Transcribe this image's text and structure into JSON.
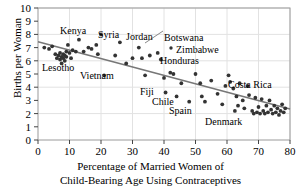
{
  "chart_data": {
    "type": "scatter",
    "title": "",
    "xlabel": "Percentage of Married Women of Child-Bearing Age Using Contraceptives",
    "xlabel_line1": "Percentage of Married Women of",
    "xlabel_line2": "Child-Bearing Age Using Contraceptives",
    "ylabel": "Births per Woman",
    "xlim": [
      0,
      80
    ],
    "ylim": [
      0,
      10
    ],
    "xticks": [
      0,
      10,
      20,
      30,
      40,
      50,
      60,
      70,
      80
    ],
    "yticks": [
      0,
      1,
      2,
      3,
      4,
      5,
      6,
      7,
      8,
      9,
      10
    ],
    "grid": "both, light gray at x ticks every 10 and y ticks every 2",
    "legend": "none",
    "point_color": "#333333",
    "trendline_color": "#777777",
    "trendline": {
      "x": [
        0,
        80
      ],
      "y": [
        7.45,
        2.35
      ],
      "label": "least-squares regression line"
    },
    "points": [
      {
        "x": 2.0,
        "y": 7.0
      },
      {
        "x": 3.5,
        "y": 6.9
      },
      {
        "x": 4.5,
        "y": 7.1
      },
      {
        "x": 5.5,
        "y": 6.5
      },
      {
        "x": 6.0,
        "y": 6.2
      },
      {
        "x": 6.5,
        "y": 6.4
      },
      {
        "x": 7.0,
        "y": 6.6
      },
      {
        "x": 7.0,
        "y": 6.1
      },
      {
        "x": 7.5,
        "y": 6.3
      },
      {
        "x": 7.5,
        "y": 5.8
      },
      {
        "x": 8.0,
        "y": 6.5
      },
      {
        "x": 8.0,
        "y": 6.2
      },
      {
        "x": 8.5,
        "y": 6.4
      },
      {
        "x": 8.5,
        "y": 6.0
      },
      {
        "x": 9.0,
        "y": 6.7
      },
      {
        "x": 9.0,
        "y": 6.3
      },
      {
        "x": 9.5,
        "y": 7.2
      },
      {
        "x": 10.0,
        "y": 6.6
      },
      {
        "x": 10.5,
        "y": 6.2
      },
      {
        "x": 11.0,
        "y": 6.8
      },
      {
        "x": 12.0,
        "y": 6.7
      },
      {
        "x": 13.0,
        "y": 7.6
      },
      {
        "x": 14.5,
        "y": 6.7
      },
      {
        "x": 16.0,
        "y": 7.0
      },
      {
        "x": 17.0,
        "y": 6.9
      },
      {
        "x": 18.5,
        "y": 7.2
      },
      {
        "x": 19.0,
        "y": 6.5
      },
      {
        "x": 20.0,
        "y": 8.0
      },
      {
        "x": 21.0,
        "y": 4.9
      },
      {
        "x": 24.5,
        "y": 6.4
      },
      {
        "x": 26.0,
        "y": 7.4
      },
      {
        "x": 28.0,
        "y": 5.8
      },
      {
        "x": 30.0,
        "y": 6.2
      },
      {
        "x": 32.0,
        "y": 7.0
      },
      {
        "x": 33.0,
        "y": 6.2
      },
      {
        "x": 34.0,
        "y": 4.9
      },
      {
        "x": 35.5,
        "y": 6.4
      },
      {
        "x": 38.0,
        "y": 6.6
      },
      {
        "x": 39.0,
        "y": 6.1
      },
      {
        "x": 40.0,
        "y": 4.7
      },
      {
        "x": 40.5,
        "y": 3.6
      },
      {
        "x": 42.0,
        "y": 5.1
      },
      {
        "x": 43.0,
        "y": 5.0
      },
      {
        "x": 44.0,
        "y": 3.3
      },
      {
        "x": 45.5,
        "y": 4.3
      },
      {
        "x": 48.0,
        "y": 2.9
      },
      {
        "x": 50.0,
        "y": 5.0
      },
      {
        "x": 51.5,
        "y": 4.3
      },
      {
        "x": 52.0,
        "y": 3.3
      },
      {
        "x": 53.0,
        "y": 2.9
      },
      {
        "x": 55.0,
        "y": 4.5
      },
      {
        "x": 57.0,
        "y": 3.5
      },
      {
        "x": 58.5,
        "y": 2.7
      },
      {
        "x": 59.5,
        "y": 4.1
      },
      {
        "x": 60.5,
        "y": 4.9
      },
      {
        "x": 61.0,
        "y": 4.4
      },
      {
        "x": 62.0,
        "y": 3.9
      },
      {
        "x": 62.5,
        "y": 2.2
      },
      {
        "x": 63.0,
        "y": 3.3
      },
      {
        "x": 63.5,
        "y": 2.6
      },
      {
        "x": 64.0,
        "y": 4.3
      },
      {
        "x": 65.0,
        "y": 3.0
      },
      {
        "x": 65.5,
        "y": 2.4
      },
      {
        "x": 66.5,
        "y": 4.1
      },
      {
        "x": 67.0,
        "y": 3.4
      },
      {
        "x": 68.0,
        "y": 2.2
      },
      {
        "x": 68.5,
        "y": 2.0
      },
      {
        "x": 69.0,
        "y": 3.2
      },
      {
        "x": 69.5,
        "y": 2.1
      },
      {
        "x": 70.0,
        "y": 2.5
      },
      {
        "x": 70.5,
        "y": 2.0
      },
      {
        "x": 71.0,
        "y": 3.1
      },
      {
        "x": 71.5,
        "y": 2.2
      },
      {
        "x": 72.0,
        "y": 2.0
      },
      {
        "x": 72.5,
        "y": 2.6
      },
      {
        "x": 73.0,
        "y": 2.1
      },
      {
        "x": 73.5,
        "y": 3.0
      },
      {
        "x": 74.0,
        "y": 2.3
      },
      {
        "x": 74.5,
        "y": 2.0
      },
      {
        "x": 75.0,
        "y": 2.6
      },
      {
        "x": 75.5,
        "y": 2.1
      },
      {
        "x": 76.0,
        "y": 2.4
      },
      {
        "x": 76.5,
        "y": 1.9
      },
      {
        "x": 77.0,
        "y": 2.2
      },
      {
        "x": 77.5,
        "y": 2.7
      },
      {
        "x": 78.0,
        "y": 2.1
      },
      {
        "x": 78.5,
        "y": 2.4
      }
    ],
    "annotations": [
      {
        "name": "Kenya",
        "label_x": 60,
        "label_y": 26,
        "leader": false
      },
      {
        "name": "Syria",
        "label_x": 98,
        "label_y": 30,
        "leader": false
      },
      {
        "name": "Jordan",
        "label_x": 126,
        "label_y": 32,
        "leader": false
      },
      {
        "name": "Botswana",
        "label_x": 164,
        "label_y": 33,
        "leader": true
      },
      {
        "name": "Zimbabwe",
        "label_x": 176,
        "label_y": 45,
        "leader": false
      },
      {
        "name": "Honduras",
        "label_x": 160,
        "label_y": 56,
        "leader": false
      },
      {
        "name": "Lesotho",
        "label_x": 42,
        "label_y": 63,
        "leader": false
      },
      {
        "name": "Vietnam",
        "label_x": 80,
        "label_y": 71,
        "leader": false
      },
      {
        "name": "Fiji",
        "label_x": 140,
        "label_y": 87,
        "leader": false
      },
      {
        "name": "Chile",
        "label_x": 152,
        "label_y": 97,
        "leader": false
      },
      {
        "name": "Spain",
        "label_x": 169,
        "label_y": 106,
        "leader": false
      },
      {
        "name": "Costa Rica",
        "label_x": 228,
        "label_y": 80,
        "leader": false
      },
      {
        "name": "Denmark",
        "label_x": 205,
        "label_y": 117,
        "leader": false
      }
    ]
  }
}
